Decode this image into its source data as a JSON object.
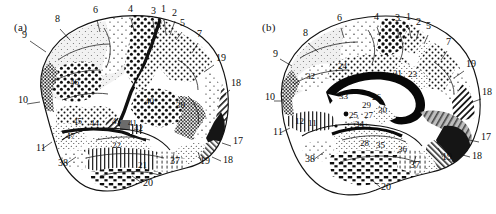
{
  "figure": {
    "type": "brodmann-cytoarchitectonic-map",
    "panels": [
      {
        "id": "a",
        "caption": "(a)",
        "view": "lateral",
        "labels": [
          {
            "text": "9",
            "x": 22,
            "y": 38
          },
          {
            "text": "8",
            "x": 55,
            "y": 22
          },
          {
            "text": "6",
            "x": 93,
            "y": 13
          },
          {
            "text": "4",
            "x": 128,
            "y": 12
          },
          {
            "text": "3",
            "x": 151,
            "y": 14
          },
          {
            "text": "1",
            "x": 161,
            "y": 12
          },
          {
            "text": "2",
            "x": 172,
            "y": 16
          },
          {
            "text": "5",
            "x": 180,
            "y": 26
          },
          {
            "text": "7",
            "x": 197,
            "y": 37
          },
          {
            "text": "19",
            "x": 216,
            "y": 61
          },
          {
            "text": "18",
            "x": 231,
            "y": 86
          },
          {
            "text": "17",
            "x": 233,
            "y": 144
          },
          {
            "text": "18",
            "x": 223,
            "y": 163
          },
          {
            "text": "19",
            "x": 200,
            "y": 164
          },
          {
            "text": "37",
            "x": 170,
            "y": 164
          },
          {
            "text": "20",
            "x": 143,
            "y": 186
          },
          {
            "text": "38",
            "x": 58,
            "y": 166
          },
          {
            "text": "11",
            "x": 36,
            "y": 151
          },
          {
            "text": "10",
            "x": 18,
            "y": 103
          }
        ],
        "inner_labels": [
          {
            "text": "46",
            "x": 70,
            "y": 85
          },
          {
            "text": "45",
            "x": 73,
            "y": 124
          },
          {
            "text": "47",
            "x": 66,
            "y": 139
          },
          {
            "text": "44",
            "x": 90,
            "y": 126
          },
          {
            "text": "43",
            "x": 112,
            "y": 124
          },
          {
            "text": "41",
            "x": 128,
            "y": 126
          },
          {
            "text": "42",
            "x": 134,
            "y": 131
          },
          {
            "text": "40",
            "x": 145,
            "y": 104
          },
          {
            "text": "22",
            "x": 112,
            "y": 148
          },
          {
            "text": "21",
            "x": 138,
            "y": 168
          },
          {
            "text": "39",
            "x": 176,
            "y": 108
          }
        ]
      },
      {
        "id": "b",
        "caption": "(b)",
        "view": "medial",
        "labels": [
          {
            "text": "9",
            "x": 25,
            "y": 57
          },
          {
            "text": "8",
            "x": 55,
            "y": 36
          },
          {
            "text": "6",
            "x": 89,
            "y": 21
          },
          {
            "text": "4",
            "x": 126,
            "y": 20
          },
          {
            "text": "3",
            "x": 147,
            "y": 21
          },
          {
            "text": "1",
            "x": 158,
            "y": 20
          },
          {
            "text": "2",
            "x": 168,
            "y": 25
          },
          {
            "text": "5",
            "x": 178,
            "y": 29
          },
          {
            "text": "7",
            "x": 198,
            "y": 45
          },
          {
            "text": "19",
            "x": 218,
            "y": 67
          },
          {
            "text": "18",
            "x": 234,
            "y": 95
          },
          {
            "text": "17",
            "x": 233,
            "y": 140
          },
          {
            "text": "18",
            "x": 224,
            "y": 159
          },
          {
            "text": "19",
            "x": 194,
            "y": 160
          },
          {
            "text": "37",
            "x": 162,
            "y": 168
          },
          {
            "text": "20",
            "x": 133,
            "y": 190
          },
          {
            "text": "38",
            "x": 57,
            "y": 162
          },
          {
            "text": "11",
            "x": 25,
            "y": 135
          },
          {
            "text": "10",
            "x": 17,
            "y": 100
          }
        ],
        "inner_labels": [
          {
            "text": "32",
            "x": 58,
            "y": 79
          },
          {
            "text": "24",
            "x": 90,
            "y": 69
          },
          {
            "text": "31",
            "x": 145,
            "y": 76
          },
          {
            "text": "23",
            "x": 160,
            "y": 77
          },
          {
            "text": "33",
            "x": 91,
            "y": 99
          },
          {
            "text": "26",
            "x": 124,
            "y": 100
          },
          {
            "text": "29",
            "x": 114,
            "y": 108
          },
          {
            "text": "30",
            "x": 130,
            "y": 113
          },
          {
            "text": "25",
            "x": 101,
            "y": 118
          },
          {
            "text": "27",
            "x": 116,
            "y": 118
          },
          {
            "text": "34",
            "x": 107,
            "y": 127
          },
          {
            "text": "12",
            "x": 47,
            "y": 124
          },
          {
            "text": "11",
            "x": 60,
            "y": 126
          },
          {
            "text": "28",
            "x": 112,
            "y": 146
          },
          {
            "text": "35",
            "x": 128,
            "y": 148
          },
          {
            "text": "36",
            "x": 150,
            "y": 152
          }
        ]
      }
    ]
  },
  "colors": {
    "ink": "#111111",
    "paper": "#ffffff",
    "mid_gray": "#8d8d8d",
    "light_gray": "#d7d7d7"
  }
}
